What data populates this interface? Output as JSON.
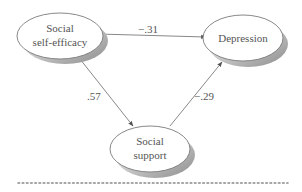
{
  "diagram": {
    "nodes": [
      {
        "id": "self_efficacy",
        "lines": [
          "Social",
          "self-efficacy"
        ]
      },
      {
        "id": "depression",
        "lines": [
          "Depression"
        ]
      },
      {
        "id": "support",
        "lines": [
          "Social",
          "support"
        ]
      }
    ],
    "edges": [
      {
        "from": "self_efficacy",
        "to": "depression",
        "label": "−.31"
      },
      {
        "from": "self_efficacy",
        "to": "support",
        "label": ".57"
      },
      {
        "from": "support",
        "to": "depression",
        "label": "−.29"
      }
    ],
    "colors": {
      "line": "#7a7a7a",
      "text": "#555555",
      "shadow": "#9a9a9a",
      "dots": "#8a8a8a"
    }
  }
}
